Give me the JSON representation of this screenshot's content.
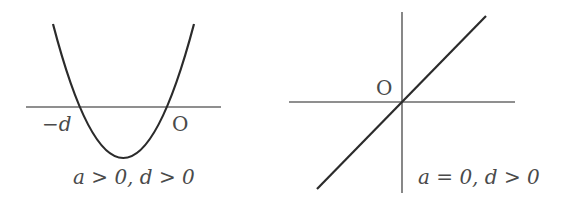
{
  "figures": [
    {
      "id": "left",
      "origin_label": "O",
      "root_label": "−d",
      "caption": "a > 0, d > 0",
      "curve": "parabola"
    },
    {
      "id": "right",
      "origin_label": "O",
      "caption": "a = 0, d > 0",
      "curve": "line"
    }
  ],
  "colors": {
    "curve": "#2b2b2b",
    "axis": "#6a6a6a",
    "text": "#4a4a4a"
  }
}
